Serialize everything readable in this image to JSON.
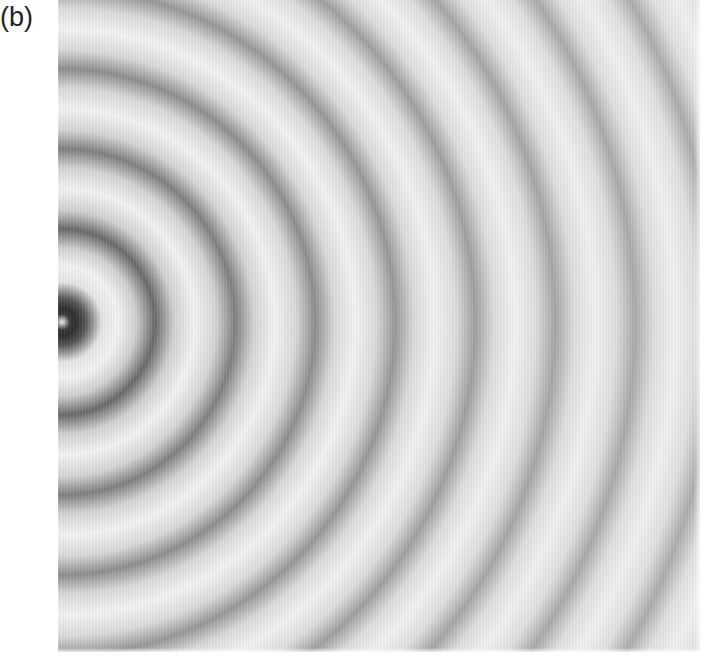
{
  "figure": {
    "panel_label": "(b)",
    "center_px": {
      "x": 62,
      "y": 322
    },
    "ring_spacing_px": 80,
    "dark_ring_radii_px": [
      12,
      93,
      173,
      253,
      333,
      413,
      493,
      573,
      653,
      733,
      813
    ],
    "colors": {
      "background_light": "#f4f4f4",
      "center_dark": "#2e2e2e",
      "inner_ring_dark": "#6a6a6a",
      "outer_ring_dark": "#b2b2b2",
      "page_background": "#ffffff"
    }
  }
}
